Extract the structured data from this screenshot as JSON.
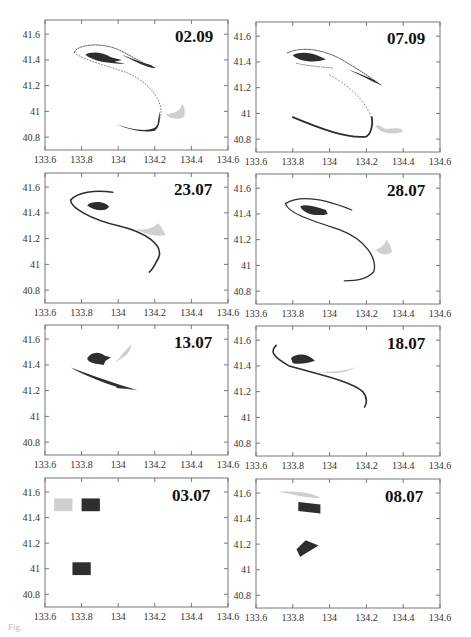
{
  "figure": {
    "caption_fragment": "Fig."
  },
  "panels": [
    {
      "label": "02.09"
    },
    {
      "label": "07.09"
    },
    {
      "label": "23.07"
    },
    {
      "label": "28.07"
    },
    {
      "label": "13.07"
    },
    {
      "label": "18.07"
    },
    {
      "label": "03.07"
    },
    {
      "label": "08.07"
    }
  ],
  "axes": {
    "x_ticks": [
      "133.6",
      "133.8",
      "134",
      "134.2",
      "134.4",
      "134.6"
    ],
    "y_ticks": [
      "41.6",
      "41.4",
      "41.2",
      "41",
      "40.8"
    ]
  },
  "colors": {
    "dark_tracer": "#2e2e2e",
    "medium_tracer": "#4a4a4a",
    "light_tracer": "#cfcfcf",
    "frame": "#777777"
  },
  "chart_data": [
    {
      "type": "scatter",
      "title": "02.09",
      "xlabel": "",
      "ylabel": "",
      "xlim": [
        133.6,
        134.6
      ],
      "ylim": [
        40.7,
        41.71
      ],
      "x_ticks": [
        133.6,
        133.8,
        134,
        134.2,
        134.4,
        134.6
      ],
      "y_ticks": [
        40.8,
        41,
        41.2,
        41.4,
        41.6
      ],
      "grid": false,
      "series": [
        {
          "name": "dark patch",
          "shade": "dark",
          "approx_extent": {
            "x": [
              133.82,
              134.05
            ],
            "y": [
              41.37,
              41.46
            ]
          }
        },
        {
          "name": "thin filament (dotted S)",
          "shade": "dark",
          "approx_extent": {
            "x": [
              133.75,
              134.23
            ],
            "y": [
              40.85,
              41.53
            ]
          }
        },
        {
          "name": "dark tail NE",
          "shade": "dark",
          "approx_extent": {
            "x": [
              133.95,
              134.2
            ],
            "y": [
              41.33,
              41.5
            ]
          }
        },
        {
          "name": "dark arc S",
          "shade": "dark",
          "approx_extent": {
            "x": [
              133.97,
              134.23
            ],
            "y": [
              40.84,
              40.9
            ]
          }
        },
        {
          "name": "light patch",
          "shade": "light",
          "approx_extent": {
            "x": [
              134.25,
              134.37
            ],
            "y": [
              40.93,
              41.05
            ]
          }
        }
      ]
    },
    {
      "type": "scatter",
      "title": "07.09",
      "xlim": [
        133.6,
        134.6
      ],
      "ylim": [
        40.7,
        41.71
      ],
      "series": [
        {
          "name": "dark patch",
          "shade": "dark",
          "approx_extent": {
            "x": [
              133.8,
              133.97
            ],
            "y": [
              41.4,
              41.47
            ]
          }
        },
        {
          "name": "dark tail NE",
          "shade": "dark",
          "approx_extent": {
            "x": [
              134.0,
              134.28
            ],
            "y": [
              41.22,
              41.45
            ]
          }
        },
        {
          "name": "thin filament",
          "shade": "dark",
          "approx_extent": {
            "x": [
              133.77,
              134.23
            ],
            "y": [
              40.85,
              41.5
            ]
          }
        },
        {
          "name": "dark arc S",
          "shade": "dark",
          "approx_extent": {
            "x": [
              133.8,
              134.23
            ],
            "y": [
              40.81,
              40.97
            ]
          }
        },
        {
          "name": "light patch",
          "shade": "light",
          "approx_extent": {
            "x": [
              134.25,
              134.4
            ],
            "y": [
              40.82,
              40.92
            ]
          }
        }
      ]
    },
    {
      "type": "scatter",
      "title": "23.07",
      "xlim": [
        133.6,
        134.6
      ],
      "ylim": [
        40.7,
        41.71
      ],
      "series": [
        {
          "name": "dark patch",
          "shade": "dark",
          "approx_extent": {
            "x": [
              133.82,
              133.95
            ],
            "y": [
              41.42,
              41.48
            ]
          }
        },
        {
          "name": "S filament",
          "shade": "dark",
          "approx_extent": {
            "x": [
              133.73,
              134.23
            ],
            "y": [
              40.94,
              41.57
            ]
          }
        },
        {
          "name": "light patch",
          "shade": "light",
          "approx_extent": {
            "x": [
              134.12,
              134.26
            ],
            "y": [
              41.2,
              41.3
            ]
          }
        }
      ]
    },
    {
      "type": "scatter",
      "title": "28.07",
      "xlim": [
        133.6,
        134.6
      ],
      "ylim": [
        40.7,
        41.71
      ],
      "series": [
        {
          "name": "dark patch",
          "shade": "dark",
          "approx_extent": {
            "x": [
              133.85,
              133.99
            ],
            "y": [
              41.38,
              41.47
            ]
          }
        },
        {
          "name": "S filament",
          "shade": "dark",
          "approx_extent": {
            "x": [
              133.75,
              134.25
            ],
            "y": [
              40.88,
              41.53
            ]
          }
        },
        {
          "name": "light patch",
          "shade": "light",
          "approx_extent": {
            "x": [
              134.25,
              134.33
            ],
            "y": [
              41.05,
              41.2
            ]
          }
        }
      ]
    },
    {
      "type": "scatter",
      "title": "13.07",
      "xlim": [
        133.6,
        134.6
      ],
      "ylim": [
        40.7,
        41.71
      ],
      "series": [
        {
          "name": "dark patch",
          "shade": "dark",
          "approx_extent": {
            "x": [
              133.82,
              133.95
            ],
            "y": [
              41.4,
              41.5
            ]
          }
        },
        {
          "name": "dark streak",
          "shade": "dark",
          "approx_extent": {
            "x": [
              133.74,
              134.11
            ],
            "y": [
              41.2,
              41.38
            ]
          }
        },
        {
          "name": "light patch",
          "shade": "light",
          "approx_extent": {
            "x": [
              133.98,
              134.08
            ],
            "y": [
              41.4,
              41.55
            ]
          }
        }
      ]
    },
    {
      "type": "scatter",
      "title": "18.07",
      "xlim": [
        133.6,
        134.6
      ],
      "ylim": [
        40.7,
        41.71
      ],
      "series": [
        {
          "name": "dark patch",
          "shade": "dark",
          "approx_extent": {
            "x": [
              133.78,
              133.92
            ],
            "y": [
              41.4,
              41.5
            ]
          }
        },
        {
          "name": "dark filament",
          "shade": "dark",
          "approx_extent": {
            "x": [
              133.68,
              134.2
            ],
            "y": [
              41.08,
              41.56
            ]
          }
        },
        {
          "name": "light streak",
          "shade": "light",
          "approx_extent": {
            "x": [
              133.95,
              134.15
            ],
            "y": [
              41.32,
              41.42
            ]
          }
        }
      ]
    },
    {
      "type": "scatter",
      "title": "03.07",
      "xlim": [
        133.6,
        134.6
      ],
      "ylim": [
        40.7,
        41.71
      ],
      "series": [
        {
          "name": "light square",
          "shade": "light",
          "approx_extent": {
            "x": [
              133.65,
              133.75
            ],
            "y": [
              41.45,
              41.55
            ]
          }
        },
        {
          "name": "dark square N",
          "shade": "dark",
          "approx_extent": {
            "x": [
              133.8,
              133.9
            ],
            "y": [
              41.45,
              41.55
            ]
          }
        },
        {
          "name": "dark square S",
          "shade": "dark",
          "approx_extent": {
            "x": [
              133.75,
              133.85
            ],
            "y": [
              40.95,
              41.05
            ]
          }
        }
      ]
    },
    {
      "type": "scatter",
      "title": "08.07",
      "xlim": [
        133.6,
        134.6
      ],
      "ylim": [
        40.7,
        41.71
      ],
      "series": [
        {
          "name": "light patch",
          "shade": "light",
          "approx_extent": {
            "x": [
              133.72,
              133.95
            ],
            "y": [
              41.55,
              41.62
            ]
          }
        },
        {
          "name": "dark patch N",
          "shade": "dark",
          "approx_extent": {
            "x": [
              133.83,
              133.95
            ],
            "y": [
              41.44,
              41.53
            ]
          }
        },
        {
          "name": "dark patch S",
          "shade": "dark",
          "approx_extent": {
            "x": [
              133.82,
              133.94
            ],
            "y": [
              41.1,
              41.23
            ]
          }
        }
      ]
    }
  ]
}
